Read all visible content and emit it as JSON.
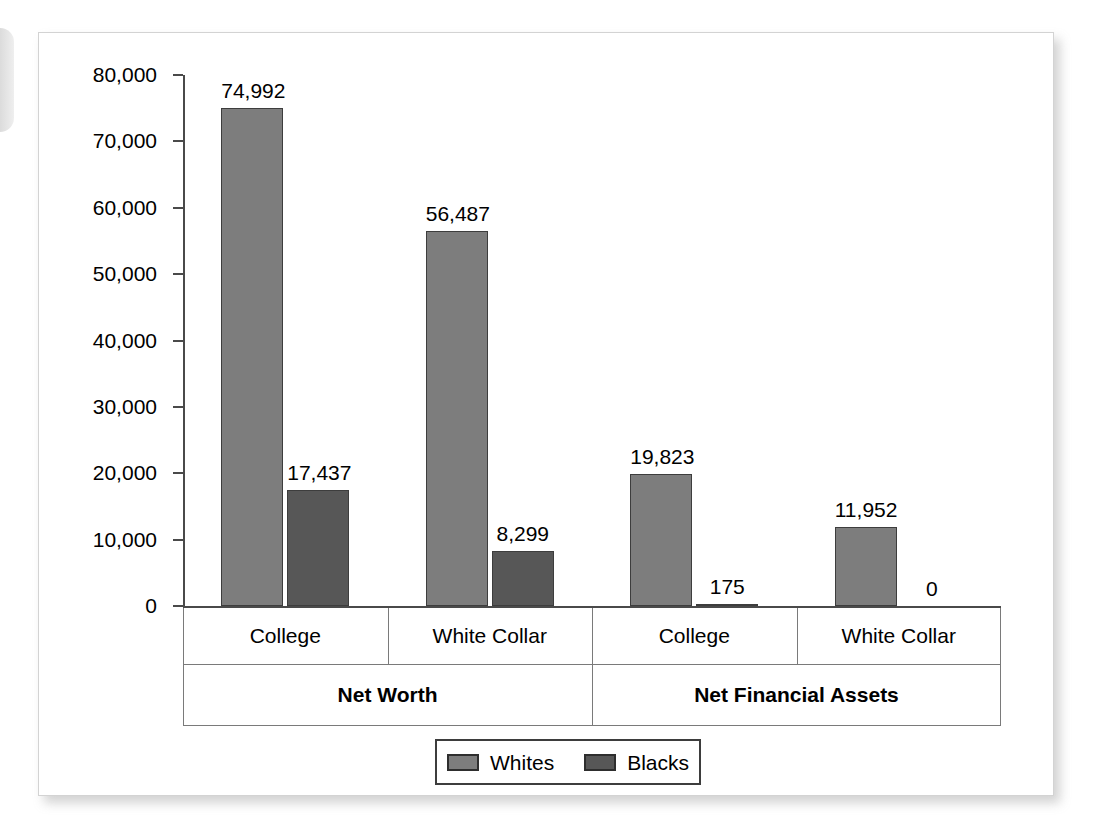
{
  "chart_data": {
    "type": "bar",
    "title": "",
    "xlabel": "",
    "ylabel": "",
    "ylim": [
      0,
      80000
    ],
    "grid": false,
    "legend_position": "bottom",
    "y_ticks": [
      "0",
      "10,000",
      "20,000",
      "30,000",
      "40,000",
      "50,000",
      "60,000",
      "70,000",
      "80,000"
    ],
    "y_tick_values": [
      0,
      10000,
      20000,
      30000,
      40000,
      50000,
      60000,
      70000,
      80000
    ],
    "groups": [
      {
        "label": "Net Worth",
        "categories": [
          "College",
          "White Collar"
        ]
      },
      {
        "label": "Net Financial Assets",
        "categories": [
          "College",
          "White Collar"
        ]
      }
    ],
    "categories": [
      "College",
      "White Collar",
      "College",
      "White Collar"
    ],
    "series": [
      {
        "name": "Whites",
        "color": "#7d7d7d",
        "values": [
          74992,
          56487,
          19823,
          11952
        ],
        "labels": [
          "74,992",
          "56,487",
          "19,823",
          "11,952"
        ]
      },
      {
        "name": "Blacks",
        "color": "#575757",
        "values": [
          17437,
          8299,
          175,
          0
        ],
        "labels": [
          "17,437",
          "8,299",
          "175",
          "0"
        ]
      }
    ]
  },
  "legend": {
    "items": [
      {
        "label": "Whites",
        "swatch": "legend-swatch-whites"
      },
      {
        "label": "Blacks",
        "swatch": "legend-swatch-blacks"
      }
    ]
  }
}
